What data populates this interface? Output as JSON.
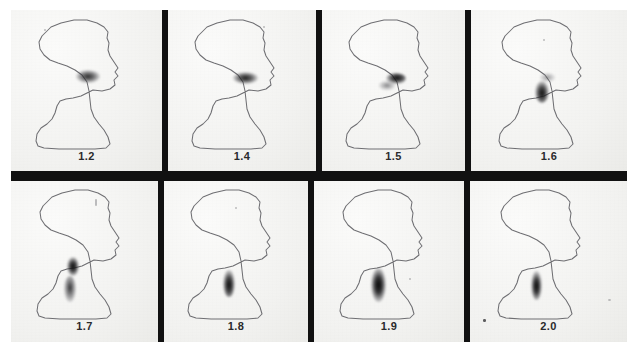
{
  "figure": {
    "name": "sequential-profile-scintigrams",
    "background_color": "#ffffff",
    "divider_color": "#111111",
    "panel_background": "#f4f4f2",
    "outline_color": "#6e6e72",
    "blob_color": "#1a1a1a",
    "label_color": "#2a2a2c",
    "rows": 2,
    "columns": 4
  },
  "panels": [
    {
      "id": "panel-1",
      "label": "1.2",
      "row": 0,
      "column": 0,
      "subject": "head-and-neck-profile-outline",
      "uptake_region": "oral-cavity",
      "blob": {
        "cx_pct": 54,
        "cy_pct": 41,
        "w_pct": 13,
        "h_pct": 5,
        "intensity": 0.62
      }
    },
    {
      "id": "panel-2",
      "label": "1.4",
      "row": 0,
      "column": 1,
      "subject": "head-and-neck-profile-outline",
      "uptake_region": "oral-cavity",
      "blob": {
        "cx_pct": 55,
        "cy_pct": 42,
        "w_pct": 14,
        "h_pct": 5,
        "intensity": 0.72
      }
    },
    {
      "id": "panel-3",
      "label": "1.5",
      "row": 0,
      "column": 2,
      "subject": "head-and-neck-profile-outline",
      "uptake_region": "oropharynx",
      "blob": {
        "cx_pct": 52,
        "cy_pct": 45,
        "w_pct": 11,
        "h_pct": 8,
        "intensity": 0.8
      }
    },
    {
      "id": "panel-4",
      "label": "1.6",
      "row": 0,
      "column": 3,
      "subject": "head-and-neck-profile-outline",
      "uptake_region": "hypopharynx",
      "blob": {
        "cx_pct": 47,
        "cy_pct": 51,
        "w_pct": 8,
        "h_pct": 12,
        "intensity": 0.85
      }
    },
    {
      "id": "panel-5",
      "label": "1.7",
      "row": 1,
      "column": 0,
      "subject": "head-and-neck-profile-outline",
      "uptake_region": "upper-esophagus",
      "blob": {
        "cx_pct": 45,
        "cy_pct": 57,
        "w_pct": 7,
        "h_pct": 11,
        "intensity": 0.88
      }
    },
    {
      "id": "panel-6",
      "label": "1.8",
      "row": 1,
      "column": 1,
      "subject": "head-and-neck-profile-outline",
      "uptake_region": "upper-esophagus",
      "blob": {
        "cx_pct": 45,
        "cy_pct": 63,
        "w_pct": 7,
        "h_pct": 14,
        "intensity": 0.88
      }
    },
    {
      "id": "panel-7",
      "label": "1.9",
      "row": 1,
      "column": 2,
      "subject": "head-and-neck-profile-outline",
      "uptake_region": "mid-esophagus",
      "blob": {
        "cx_pct": 42,
        "cy_pct": 66,
        "w_pct": 8,
        "h_pct": 17,
        "intensity": 0.92
      }
    },
    {
      "id": "panel-8",
      "label": "2.0",
      "row": 1,
      "column": 3,
      "subject": "head-and-neck-profile-outline",
      "uptake_region": "mid-esophagus",
      "blob": {
        "cx_pct": 42,
        "cy_pct": 67,
        "w_pct": 6,
        "h_pct": 15,
        "intensity": 0.9
      }
    }
  ]
}
